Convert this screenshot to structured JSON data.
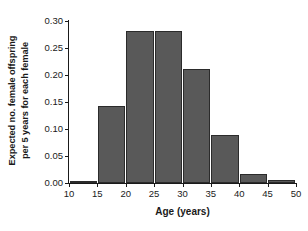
{
  "chart_data": {
    "type": "bar",
    "title": "",
    "xlabel": "Age (years)",
    "ylabel_lines": [
      "Expected no. female offspring",
      "per 5 years for each female"
    ],
    "ylabel": "Expected no. female offspring per 5 years for each female",
    "bin_width": 5,
    "x": [
      10,
      15,
      20,
      25,
      30,
      35,
      40,
      45
    ],
    "categories": [
      "10-15",
      "15-20",
      "20-25",
      "25-30",
      "30-35",
      "35-40",
      "40-45",
      "45-50"
    ],
    "values": [
      0.003,
      0.142,
      0.281,
      0.281,
      0.211,
      0.089,
      0.017,
      0.005
    ],
    "xlim": [
      10,
      50
    ],
    "ylim": [
      0.0,
      0.3
    ],
    "xticks": [
      10,
      15,
      20,
      25,
      30,
      35,
      40,
      45,
      50
    ],
    "xticklabels": [
      "10",
      "15",
      "20",
      "25",
      "30",
      "35",
      "40",
      "45",
      "50"
    ],
    "yticks": [
      0.0,
      0.05,
      0.1,
      0.15,
      0.2,
      0.25,
      0.3
    ],
    "yticklabels": [
      "0.00",
      "0.05",
      "0.10",
      "0.15",
      "0.20",
      "0.25",
      "0.30"
    ],
    "grid": false,
    "legend": null,
    "bar_color": "#595959",
    "bar_edge_color": "#2b2b2b",
    "background_color": "#ffffff",
    "axis_color": "#1a1a1a"
  }
}
